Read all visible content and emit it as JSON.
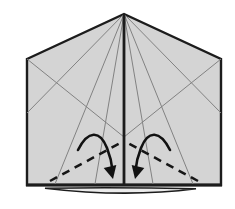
{
  "figure": {
    "type": "origami-fold-step-diagram",
    "canvas": {
      "width": 235,
      "height": 209,
      "background": "#ffffff"
    },
    "colors": {
      "paper_fill": "#d4d4d4",
      "outline": "#1c1c1c",
      "crease": "#828282",
      "fold_line": "#161616",
      "arrow": "#121212",
      "flap_fill": "#ebebeb"
    },
    "paper": {
      "outline_points": [
        [
          27,
          59
        ],
        [
          124,
          14
        ],
        [
          221,
          59
        ],
        [
          221,
          185
        ],
        [
          27,
          185
        ]
      ],
      "bottom_edge": [
        [
          26,
          185
        ],
        [
          222,
          185
        ]
      ],
      "center_line": [
        [
          124,
          14
        ],
        [
          124,
          184
        ]
      ]
    },
    "bottom_flap": {
      "path": "M 45 188.2 Q 124 187.2 196 188.8 Q 125 197.8 45 188.2 Z"
    },
    "creases": [
      [
        [
          124,
          14
        ],
        [
          27,
          113
        ]
      ],
      [
        [
          124,
          14
        ],
        [
          55,
          184
        ]
      ],
      [
        [
          124,
          14
        ],
        [
          95,
          184
        ]
      ],
      [
        [
          27,
          59
        ],
        [
          124,
          137
        ]
      ],
      [
        [
          124,
          14
        ],
        [
          221,
          113
        ]
      ],
      [
        [
          124,
          14
        ],
        [
          193,
          184
        ]
      ],
      [
        [
          124,
          14
        ],
        [
          153,
          184
        ]
      ],
      [
        [
          221,
          59
        ],
        [
          124,
          137
        ]
      ]
    ],
    "valley_folds": [
      [
        [
          50,
          181
        ],
        [
          124,
          141
        ]
      ],
      [
        [
          198,
          181
        ],
        [
          124,
          141
        ]
      ]
    ],
    "valley_dash": "8 6",
    "arrows": [
      {
        "path": "M 78 150 C 88 130 100 130 107 148 C 111 158 112 164 112.6 171",
        "head": "113,179 103.7,167.9 116.3,164.9"
      },
      {
        "path": "M 170 150 C 160 130 148 130 141 148 C 137 158 136 164 135.4 171",
        "head": "135,179 144.3,167.9 131.7,164.9"
      }
    ]
  }
}
